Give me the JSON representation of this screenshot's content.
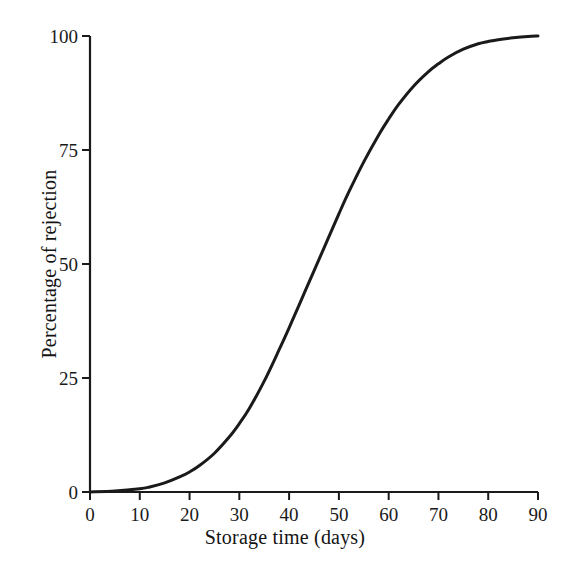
{
  "chart_data": {
    "type": "line",
    "title": "",
    "subtitle": "",
    "xlabel": "Storage time (days)",
    "ylabel": "Percentage of rejection",
    "xlim": [
      0,
      90
    ],
    "ylim": [
      0,
      100
    ],
    "xticks": [
      0,
      10,
      20,
      30,
      40,
      50,
      60,
      70,
      80,
      90
    ],
    "xticklabels": [
      "0",
      "10",
      "20",
      "30",
      "40",
      "50",
      "60",
      "70",
      "80",
      "90"
    ],
    "yticks": [
      0,
      25,
      50,
      75,
      100
    ],
    "yticklabels": [
      "0",
      "25",
      "50",
      "75",
      "100"
    ],
    "grid": false,
    "legend": false,
    "legend_position": "none",
    "line_color": "#1a1a1a",
    "line_width": 3,
    "background_color": "#ffffff",
    "axis_color": "#1a1a1a",
    "annotations": [],
    "series": [
      {
        "name": "Percentage of rejection",
        "x": [
          0,
          5,
          10,
          12,
          15,
          18,
          20,
          22,
          25,
          28,
          30,
          32,
          35,
          38,
          40,
          42,
          45,
          47,
          48,
          50,
          52,
          55,
          58,
          60,
          62,
          65,
          68,
          70,
          72,
          75,
          78,
          80,
          82,
          85,
          88,
          90
        ],
        "values": [
          0,
          0.2,
          0.7,
          1.1,
          2.0,
          3.3,
          4.4,
          5.8,
          8.5,
          12.1,
          15.0,
          18.3,
          24.3,
          31.2,
          36.0,
          41.0,
          48.5,
          53.5,
          56.0,
          61.0,
          65.8,
          72.4,
          78.3,
          81.8,
          85.0,
          89.0,
          92.2,
          93.9,
          95.4,
          97.1,
          98.3,
          98.8,
          99.2,
          99.6,
          99.9,
          100.0
        ]
      }
    ]
  },
  "axes": {
    "x_title": "Storage time (days)",
    "y_title": "Percentage of rejection"
  }
}
